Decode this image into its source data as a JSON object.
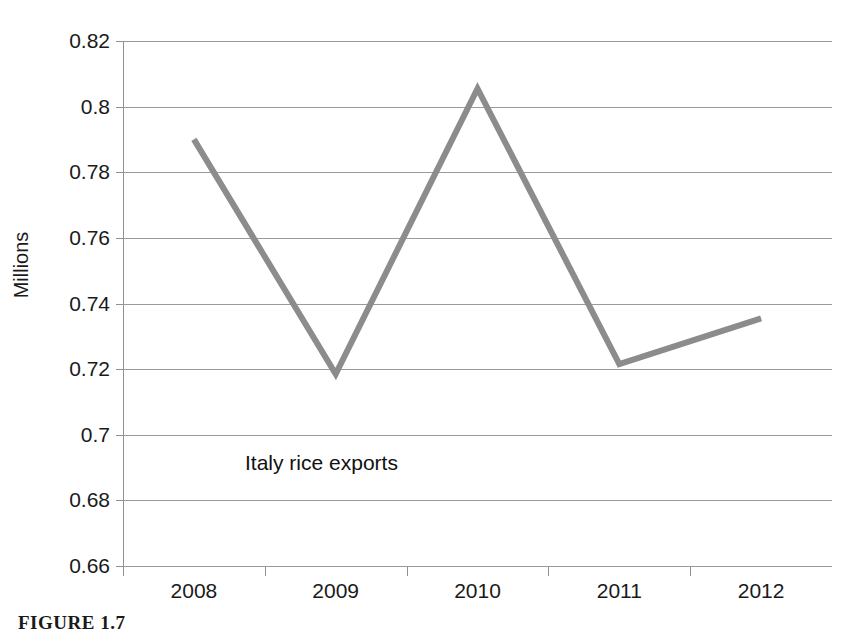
{
  "chart_data": {
    "type": "line",
    "title": "",
    "xlabel": "",
    "ylabel": "Millions",
    "categories": [
      "2008",
      "2009",
      "2010",
      "2011",
      "2012"
    ],
    "series": [
      {
        "name": "Italy rice exports",
        "values": [
          0.79,
          0.7185,
          0.8055,
          0.7215,
          0.7355
        ],
        "color": "#8c8c8c"
      }
    ],
    "ylim": [
      0.66,
      0.82
    ],
    "ytick_step": 0.02,
    "ytick_labels": [
      "0.82",
      "0.8",
      "0.78",
      "0.76",
      "0.74",
      "0.72",
      "0.7",
      "0.68",
      "0.66"
    ],
    "ytick_values": [
      0.82,
      0.8,
      0.78,
      0.76,
      0.74,
      0.72,
      0.7,
      0.68,
      0.66
    ],
    "grid": true,
    "legend_position": "none",
    "annotations": [
      {
        "text": "Italy rice exports",
        "x": 245,
        "y": 452
      }
    ]
  },
  "axis": {
    "y_title": "Millions"
  },
  "caption": {
    "text": "FIGURE 1.7"
  },
  "colors": {
    "line": "#8c8c8c",
    "grid": "#9a9a9a",
    "axis": "#8f8f8f",
    "text": "#1a1a1a",
    "background": "#ffffff"
  }
}
